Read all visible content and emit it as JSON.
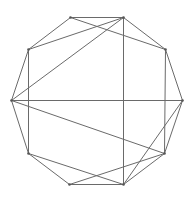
{
  "diagram": {
    "type": "graph",
    "colors": {
      "edge": "#6a6a6a",
      "vertex": "#555555",
      "background": "#ffffff"
    },
    "vertices": [
      {
        "id": "V0",
        "x": 70,
        "y": 17
      },
      {
        "id": "V1",
        "x": 123,
        "y": 17
      },
      {
        "id": "V2",
        "x": 165,
        "y": 49
      },
      {
        "id": "V3",
        "x": 182,
        "y": 100
      },
      {
        "id": "V4",
        "x": 164,
        "y": 153
      },
      {
        "id": "V5",
        "x": 123,
        "y": 184
      },
      {
        "id": "V6",
        "x": 69,
        "y": 184
      },
      {
        "id": "V7",
        "x": 28,
        "y": 153
      },
      {
        "id": "V8",
        "x": 11,
        "y": 100
      },
      {
        "id": "V9",
        "x": 28,
        "y": 49
      }
    ],
    "edges": [
      [
        0,
        1
      ],
      [
        1,
        2
      ],
      [
        2,
        3
      ],
      [
        3,
        4
      ],
      [
        4,
        5
      ],
      [
        5,
        6
      ],
      [
        6,
        7
      ],
      [
        7,
        8
      ],
      [
        8,
        9
      ],
      [
        9,
        0
      ],
      [
        0,
        2
      ],
      [
        9,
        1
      ],
      [
        8,
        1
      ],
      [
        1,
        5
      ],
      [
        9,
        7
      ],
      [
        2,
        4
      ],
      [
        8,
        3
      ],
      [
        8,
        4
      ],
      [
        7,
        5
      ],
      [
        6,
        4
      ],
      [
        3,
        5
      ]
    ]
  }
}
